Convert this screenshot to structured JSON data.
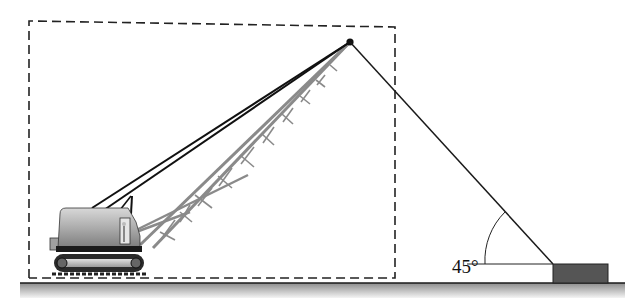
{
  "figure": {
    "type": "crane-free-body-diagram",
    "angle_label": "45°",
    "elements": {
      "crane": "lattice-boom crawler crane",
      "boundary": "dashed free-body boundary around crane",
      "cable": "cable from boom tip to ground block",
      "block": "dark block on ground",
      "ground": "shaded ground surface"
    }
  },
  "colors": {
    "cable": "#1a1a1a",
    "dashed_box": "#222222",
    "block": "#555555",
    "ground_top": "#9a9a9a",
    "ground_bottom": "#f0f0f0",
    "boom": "#8a8a8a",
    "cab": "#a8a8a8"
  }
}
